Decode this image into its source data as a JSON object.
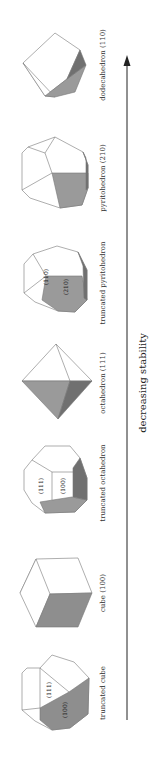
{
  "figure": {
    "axis_label": "decreasing stability",
    "arrow_direction": "up",
    "shapes": [
      {
        "name": "dodecahedron (110)",
        "face_labels": []
      },
      {
        "name": "pyritohedron (210)",
        "face_labels": []
      },
      {
        "name": "truncated pyritohedron",
        "face_labels": [
          "(110)",
          "(210)"
        ]
      },
      {
        "name": "octahedron (111)",
        "face_labels": []
      },
      {
        "name": "truncated octahedron",
        "face_labels": [
          "(111)",
          "(100)"
        ]
      },
      {
        "name": "cube (100)",
        "face_labels": []
      },
      {
        "name": "truncated cube",
        "face_labels": [
          "(111)",
          "(100)"
        ]
      }
    ],
    "colors": {
      "light_face": "#ffffff",
      "mid_face": "#9a9a9a",
      "dark_face": "#6e6e6e",
      "edge": "#666666",
      "arrow": "#222222"
    }
  }
}
